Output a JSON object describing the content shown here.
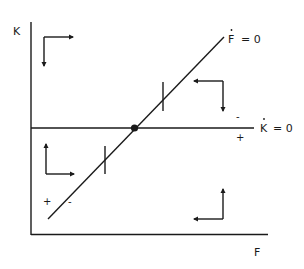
{
  "diagram": {
    "type": "phase-diagram",
    "axes": {
      "y_label": "K",
      "x_label": "F"
    },
    "curves": [
      {
        "id": "k-dot-zero",
        "label": "K̇ = 0",
        "label_text": "K",
        "label_eq": "= 0",
        "shape": "horizontal line"
      },
      {
        "id": "f-dot-zero",
        "label": "Ḟ = 0",
        "label_text": "F",
        "label_eq": "= 0",
        "shape": "upward-sloping line"
      }
    ],
    "equilibrium": {
      "marker": "filled-dot",
      "at": "intersection of K̇=0 and Ḟ=0"
    },
    "signs": {
      "k_dot_above": "-",
      "k_dot_below": "+",
      "f_dot_left": "+",
      "f_dot_right": "-"
    },
    "quadrant_arrows": [
      {
        "region": "top-left",
        "horizontal": "right",
        "vertical": "down"
      },
      {
        "region": "top-right",
        "horizontal": "left",
        "vertical": "down"
      },
      {
        "region": "bottom-left",
        "horizontal": "right",
        "vertical": "up"
      },
      {
        "region": "bottom-right",
        "horizontal": "left",
        "vertical": "up"
      }
    ],
    "ticks_on_f_dot_zero": 2,
    "colors": {
      "ink": "#1a1a1a",
      "background": "#ffffff"
    }
  }
}
